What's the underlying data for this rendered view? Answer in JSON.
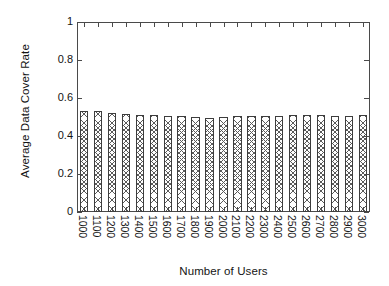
{
  "chart_data": {
    "type": "bar",
    "title": "",
    "xlabel": "Number of Users",
    "ylabel": "Average Data Cover Rate",
    "ylim": [
      0,
      1
    ],
    "yticks": [
      "0",
      "0.2",
      "0.4",
      "0.6",
      "0.8",
      "1"
    ],
    "ytick_values": [
      0,
      0.2,
      0.4,
      0.6,
      0.8,
      1
    ],
    "grid": false,
    "legend": "none",
    "bar_fill": "crosshatch-pattern",
    "bar_edge_color": "#3d3d3d",
    "categories": [
      "1000",
      "1100",
      "1200",
      "1300",
      "1400",
      "1500",
      "1600",
      "1700",
      "1800",
      "1900",
      "2000",
      "2100",
      "2200",
      "2300",
      "2400",
      "2500",
      "2600",
      "2700",
      "2800",
      "2900",
      "3000"
    ],
    "values": [
      0.532,
      0.53,
      0.521,
      0.514,
      0.508,
      0.508,
      0.505,
      0.505,
      0.5,
      0.494,
      0.501,
      0.503,
      0.505,
      0.505,
      0.504,
      0.51,
      0.509,
      0.508,
      0.507,
      0.504,
      0.513
    ]
  }
}
